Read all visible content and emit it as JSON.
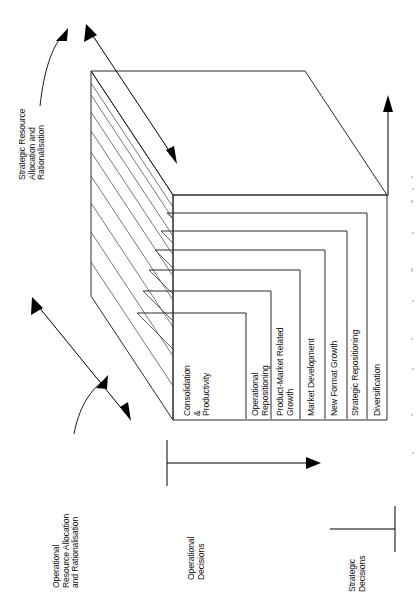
{
  "diagram": {
    "orientation": "rotated-90",
    "layers": [
      {
        "id": "layer-1",
        "label": "Consolidation\n&\nProductivity"
      },
      {
        "id": "layer-2",
        "label": "Operational\nRepositioning"
      },
      {
        "id": "layer-3",
        "label": "Product-Market Related\nGrowth"
      },
      {
        "id": "layer-4",
        "label": "Market Development"
      },
      {
        "id": "layer-5",
        "label": "New Format Growth"
      },
      {
        "id": "layer-6",
        "label": "Strategic Repositioning"
      },
      {
        "id": "layer-7",
        "label": "Diversification"
      }
    ],
    "annotations": [
      {
        "id": "annot-strategic",
        "label": "Strategic Resource\nAllocation and\nRationalisation"
      },
      {
        "id": "annot-operational",
        "label": "Operational\nResource Allocation\nand Rationalisation"
      }
    ],
    "axes": [
      {
        "id": "axis-operational",
        "label": "Operational\nDecisions"
      },
      {
        "id": "axis-strategic",
        "label": "Strategic\nDecisions"
      }
    ],
    "colors": {
      "ink": "#111111",
      "line": "#2b2b2b",
      "hatch": "#555555",
      "background": "#ffffff"
    }
  }
}
